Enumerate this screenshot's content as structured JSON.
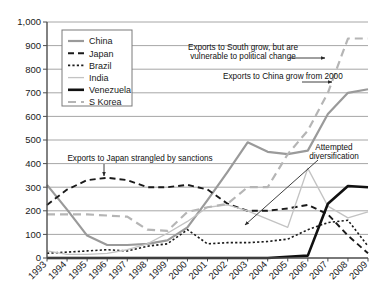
{
  "chart_data": {
    "type": "line",
    "title": "",
    "xlabel": "",
    "ylabel": "",
    "grid": true,
    "legend_position": "top-left",
    "xlim": [
      1993,
      2009
    ],
    "ylim": [
      0,
      1000
    ],
    "ytick_labels": [
      "0",
      "100",
      "200",
      "300",
      "400",
      "500",
      "600",
      "700",
      "800",
      "900",
      "1,000"
    ],
    "ytick_values": [
      0,
      100,
      200,
      300,
      400,
      500,
      600,
      700,
      800,
      900,
      1000
    ],
    "x": [
      1993,
      1994,
      1995,
      1996,
      1997,
      1998,
      1999,
      2000,
      2001,
      2002,
      2003,
      2004,
      2005,
      2006,
      2007,
      2008,
      2009
    ],
    "categories": [
      "1993",
      "1994",
      "1995",
      "1996",
      "1997",
      "1998",
      "1999",
      "2000",
      "2001",
      "2002",
      "2003",
      "2004",
      "2005",
      "2006",
      "2007",
      "2008",
      "2009"
    ],
    "series": [
      {
        "name": "China",
        "color": "#9a9a9a",
        "style": "solid",
        "width": 2.2,
        "values": [
          310,
          205,
          95,
          55,
          55,
          60,
          75,
          130,
          245,
          365,
          490,
          450,
          440,
          455,
          610,
          700,
          715
        ]
      },
      {
        "name": "Japan",
        "color": "#1a1a1a",
        "style": "dashed",
        "width": 1.9,
        "values": [
          225,
          290,
          330,
          340,
          330,
          300,
          300,
          310,
          290,
          230,
          200,
          200,
          210,
          225,
          185,
          95,
          20
        ]
      },
      {
        "name": "Brazil",
        "color": "#1a1a1a",
        "style": "dotted",
        "width": 1.6,
        "values": [
          20,
          25,
          30,
          35,
          30,
          50,
          60,
          120,
          60,
          65,
          65,
          70,
          80,
          120,
          150,
          160,
          50
        ]
      },
      {
        "name": "India",
        "color": "#c3c3c3",
        "style": "solid",
        "width": 1.3,
        "values": [
          30,
          15,
          15,
          20,
          35,
          60,
          105,
          155,
          215,
          225,
          200,
          165,
          130,
          380,
          220,
          170,
          195
        ]
      },
      {
        "name": "Venezuela",
        "color": "#111111",
        "style": "solid",
        "width": 2.6,
        "values": [
          0,
          0,
          0,
          0,
          0,
          0,
          0,
          0,
          0,
          0,
          0,
          0,
          5,
          10,
          230,
          305,
          300
        ]
      },
      {
        "name": "S Korea",
        "color": "#b5b5b5",
        "style": "longdash",
        "width": 2.2,
        "values": [
          185,
          185,
          185,
          180,
          175,
          120,
          115,
          195,
          215,
          230,
          300,
          300,
          440,
          540,
          700,
          930,
          930
        ]
      }
    ],
    "annotations": [
      {
        "id": "south-growth",
        "text_lines": [
          "Exports to South grow, but are",
          "vulnerable to political change"
        ],
        "text_x": 243,
        "text_y": 50,
        "arrow": {
          "x1": 289,
          "y1": 58,
          "x2": 325,
          "y2": 58
        }
      },
      {
        "id": "china-growth",
        "text_lines": [
          "Exports to China grow from 2000"
        ],
        "text_x": 223,
        "text_y": 79,
        "arrow": {
          "x1": 302,
          "y1": 82,
          "x2": 332,
          "y2": 82
        }
      },
      {
        "id": "japan-sanctions",
        "text_lines": [
          "Exports to Japan strangled by sanctions"
        ],
        "text_x": 140,
        "text_y": 161,
        "arrow": {
          "x1": 104,
          "y1": 164,
          "x2": 104,
          "y2": 176
        }
      },
      {
        "id": "attempted-diversification",
        "text_lines": [
          "Attempted",
          "diversification"
        ],
        "text_x": 334,
        "text_y": 150,
        "arrow": {
          "x1": 318,
          "y1": 160,
          "x2": 245,
          "y2": 225
        }
      }
    ]
  },
  "legend": {
    "items": [
      {
        "label": "China"
      },
      {
        "label": "Japan"
      },
      {
        "label": "Brazil"
      },
      {
        "label": "India"
      },
      {
        "label": "Venezuela"
      },
      {
        "label": "S Korea"
      }
    ]
  }
}
